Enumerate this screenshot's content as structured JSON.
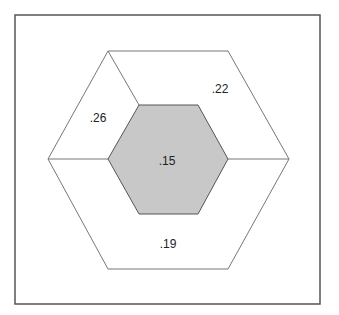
{
  "diagram": {
    "title": "",
    "regions": [
      {
        "id": "center",
        "label": ".15",
        "shaded": true
      },
      {
        "id": "upper-left",
        "label": ".26",
        "shaded": false
      },
      {
        "id": "upper-right",
        "label": ".22",
        "shaded": false
      },
      {
        "id": "bottom",
        "label": ".19",
        "shaded": false
      }
    ],
    "colors": {
      "frame": "#555555",
      "stroke": "#666666",
      "center_fill": "#c8c8c8",
      "background": "#ffffff"
    }
  }
}
